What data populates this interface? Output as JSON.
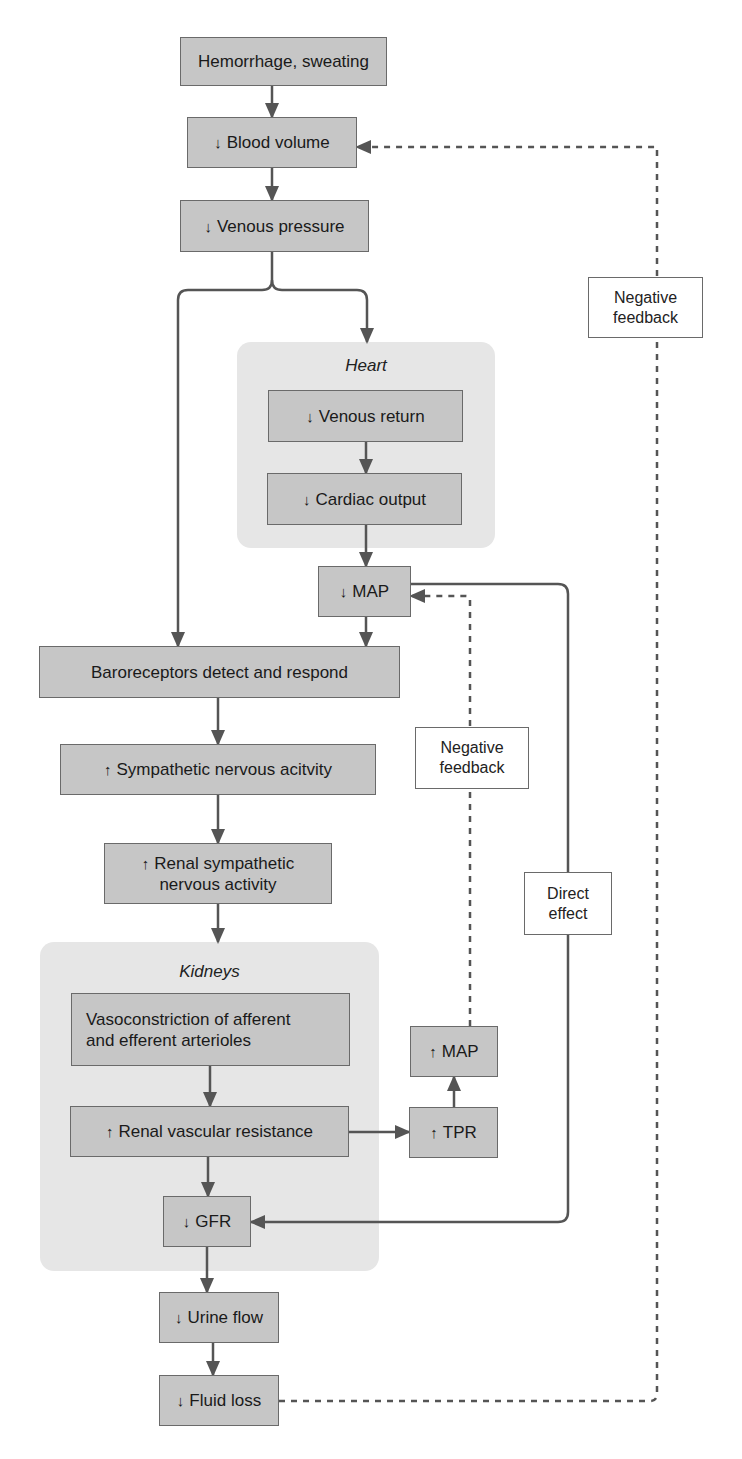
{
  "colors": {
    "box_fill": "#c6c6c6",
    "box_border": "#6a6a6a",
    "group_fill": "#e6e6e6",
    "line": "#555555",
    "note_fill": "#ffffff"
  },
  "groups": {
    "heart": {
      "title": "Heart"
    },
    "kidneys": {
      "title": "Kidneys"
    }
  },
  "nodes": {
    "hemorrhage": {
      "arrow": "",
      "text": "Hemorrhage, sweating"
    },
    "blood_volume": {
      "arrow": "↓",
      "text": "Blood volume"
    },
    "venous_pressure": {
      "arrow": "↓",
      "text": "Venous pressure"
    },
    "venous_return": {
      "arrow": "↓",
      "text": "Venous return"
    },
    "cardiac_output": {
      "arrow": "↓",
      "text": "Cardiac output"
    },
    "map_decrease": {
      "arrow": "↓",
      "text": "MAP"
    },
    "baroreceptors": {
      "arrow": "",
      "text": "Baroreceptors detect and respond"
    },
    "sympathetic": {
      "arrow": "↑",
      "text": "Sympathetic nervous acitvity"
    },
    "renal_sympathetic": {
      "arrow": "↑",
      "line1": "Renal sympathetic",
      "line2": "nervous activity"
    },
    "vasoconstriction": {
      "arrow": "",
      "line1": "Vasoconstriction of afferent",
      "line2": "and efferent arterioles"
    },
    "renal_vascular": {
      "arrow": "↑",
      "text": "Renal vascular resistance"
    },
    "gfr": {
      "arrow": "↓",
      "text": "GFR"
    },
    "map_increase": {
      "arrow": "↑",
      "text": "MAP"
    },
    "tpr": {
      "arrow": "↑",
      "text": "TPR"
    },
    "urine_flow": {
      "arrow": "↓",
      "text": "Urine flow"
    },
    "fluid_loss": {
      "arrow": "↓",
      "text": "Fluid loss"
    }
  },
  "notes": {
    "negative_feedback_outer": {
      "line1": "Negative",
      "line2": "feedback"
    },
    "negative_feedback_inner": {
      "line1": "Negative",
      "line2": "feedback"
    },
    "direct_effect": {
      "line1": "Direct",
      "line2": "effect"
    }
  }
}
